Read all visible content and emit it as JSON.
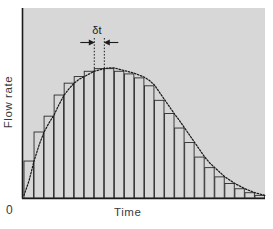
{
  "figure": {
    "background_color": "#ffffff",
    "plot_background_color": "#d7d7d7",
    "axis_color": "#1a1a1a",
    "bar_edge_color": "#2b2b2b",
    "curve_color": "#1a1a1a",
    "annotation_color": "#1c1c1c"
  },
  "labels": {
    "ylabel": "Flow rate",
    "xlabel": "Time",
    "origin": "0",
    "delta_t": "δt"
  },
  "chart_data": {
    "type": "bar",
    "title": "",
    "subtitle": "",
    "xlabel": "Time",
    "ylabel": "Flow rate",
    "grid": false,
    "legend": null,
    "legend_position": "none",
    "xlim": [
      0,
      24
    ],
    "ylim": [
      0,
      1
    ],
    "x_tick_labels": [
      "0"
    ],
    "y_tick_labels": [],
    "bar_count": 24,
    "bar_edge_only": true,
    "categories": [
      "1",
      "2",
      "3",
      "4",
      "5",
      "6",
      "7",
      "8",
      "9",
      "10",
      "11",
      "12",
      "13",
      "14",
      "15",
      "16",
      "17",
      "18",
      "19",
      "20",
      "21",
      "22",
      "23",
      "24"
    ],
    "values": [
      0.28,
      0.5,
      0.62,
      0.78,
      0.87,
      0.92,
      0.96,
      0.98,
      0.98,
      0.96,
      0.94,
      0.91,
      0.85,
      0.74,
      0.64,
      0.53,
      0.42,
      0.31,
      0.23,
      0.16,
      0.11,
      0.07,
      0.04,
      0.02
    ],
    "series": [
      {
        "name": "Histogram of flow rate",
        "type": "bar",
        "values": [
          0.28,
          0.5,
          0.62,
          0.78,
          0.87,
          0.92,
          0.96,
          0.98,
          0.98,
          0.96,
          0.94,
          0.91,
          0.85,
          0.74,
          0.64,
          0.53,
          0.42,
          0.31,
          0.23,
          0.16,
          0.11,
          0.07,
          0.04,
          0.02
        ]
      },
      {
        "name": "Smooth flow rate curve",
        "type": "line",
        "style": "dotted",
        "x": [
          0.0,
          0.5,
          1.0,
          1.5,
          2.0,
          2.5,
          3.0,
          3.5,
          4.0,
          4.5,
          5.0,
          5.5,
          6.0,
          6.5,
          7.0,
          7.5,
          8.0,
          8.5,
          9.0,
          9.5,
          10.0,
          10.5,
          11.0,
          11.5,
          12.0,
          12.5,
          13.0,
          13.5,
          14.0,
          14.5,
          15.0,
          15.5,
          16.0,
          16.5,
          17.0,
          17.5,
          18.0,
          18.5,
          19.0,
          19.5,
          20.0,
          20.5,
          21.0,
          21.5,
          22.0,
          22.5,
          23.0,
          23.5,
          24.0
        ],
        "y": [
          0.02,
          0.13,
          0.28,
          0.4,
          0.5,
          0.57,
          0.63,
          0.71,
          0.78,
          0.83,
          0.87,
          0.9,
          0.92,
          0.94,
          0.96,
          0.97,
          0.98,
          0.985,
          0.985,
          0.975,
          0.965,
          0.955,
          0.945,
          0.93,
          0.915,
          0.89,
          0.855,
          0.8,
          0.745,
          0.69,
          0.635,
          0.585,
          0.53,
          0.475,
          0.42,
          0.365,
          0.31,
          0.265,
          0.23,
          0.195,
          0.16,
          0.135,
          0.11,
          0.09,
          0.07,
          0.055,
          0.04,
          0.03,
          0.02
        ]
      }
    ],
    "annotations": [
      {
        "name": "delta-t",
        "label": "δt",
        "description": "Width of one histogram bar marked by inward arrows and dotted drop-lines",
        "bar_index": 8,
        "x_start": 7,
        "x_end": 8
      }
    ]
  }
}
